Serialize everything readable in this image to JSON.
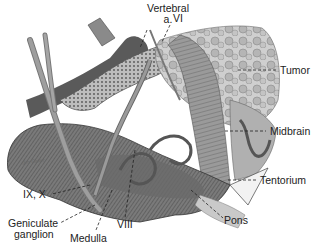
{
  "figure": {
    "artist_signature": "Jim Gaiter"
  },
  "labels": {
    "vertebral_a": {
      "line1": "Vertebral",
      "line2": "a."
    },
    "vi": "VI",
    "tumor": "Tumor",
    "midbrain": "Midbrain",
    "tentorium": "Tentorium",
    "pons": "Pons",
    "viii": "VIII",
    "medulla": "Medulla",
    "geniculate_ganglion": {
      "line1": "Geniculate",
      "line2": "ganglion"
    },
    "ix_x": "IX, X"
  },
  "colors": {
    "background": "#ffffff",
    "dark_tissue": "#555555",
    "mid_tissue": "#8a8a8a",
    "light_tissue": "#c8c8c8",
    "bone": "#e6e6e6",
    "text": "#222222"
  }
}
